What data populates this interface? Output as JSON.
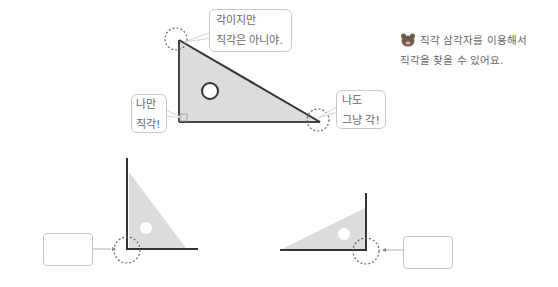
{
  "top_diagram": {
    "bubble_top": {
      "line1": "각이지만",
      "line2": "직각은 아니야."
    },
    "bubble_left": {
      "line1": "나만",
      "line2": "직각!"
    },
    "bubble_right": {
      "line1": "나도",
      "line2": "그냥 각!"
    }
  },
  "note": {
    "icon": "mascot-icon",
    "line1": "직각 삼각자를 이용해서",
    "line2": "직각을 찾을 수 있어요."
  },
  "bottom_left": {
    "answer_box": ""
  },
  "bottom_right": {
    "answer_box": ""
  },
  "colors": {
    "triangle_fill": "#dcdcdc",
    "line": "#333333",
    "dash": "#555555",
    "bubble_border": "#c8c8c8"
  }
}
